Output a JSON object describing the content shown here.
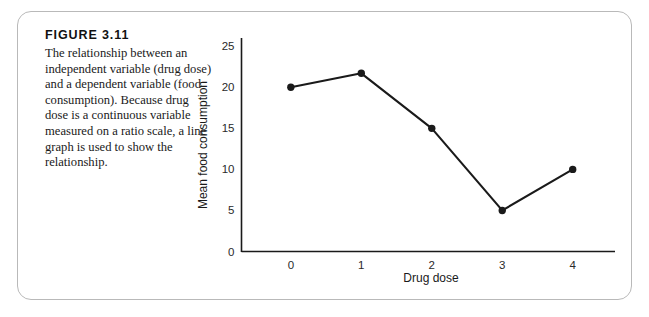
{
  "figure": {
    "label": "FIGURE 3.11",
    "caption": "The relationship between an independent variable (drug dose) and a dependent variable (food consumption). Because drug dose is a continuous variable measured on a ratio scale, a line graph is used to show the relationship."
  },
  "chart_data": {
    "type": "line",
    "title": "",
    "xlabel": "Drug dose",
    "ylabel": "Mean food consumption",
    "categories": [
      "0",
      "1",
      "2",
      "3",
      "4"
    ],
    "x": [
      0,
      1,
      2,
      3,
      4
    ],
    "values": [
      20,
      21.7,
      15,
      5,
      10
    ],
    "ylim": [
      0,
      26
    ],
    "xlim": [
      -0.7,
      4.6
    ],
    "yticks": [
      0,
      5,
      10,
      15,
      20,
      25
    ],
    "ytick_labels": [
      "0",
      "5",
      "10",
      "15",
      "20",
      "25"
    ],
    "xticks": [
      0,
      1,
      2,
      3,
      4
    ],
    "xtick_labels": [
      "0",
      "1",
      "2",
      "3",
      "4"
    ],
    "grid": false,
    "legend": "none",
    "marker": "filled-circle",
    "line_color": "#1a1a1a",
    "marker_color": "#1a1a1a"
  },
  "style": {
    "card_border_color": "#b9b9b9",
    "background": "#ffffff",
    "text_color": "#1a1a1a"
  }
}
